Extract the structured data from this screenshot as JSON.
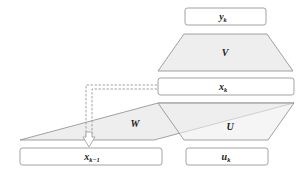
{
  "diagram": {
    "type": "recurrent-network-unrolled-step",
    "nodes": {
      "output": {
        "label": "y",
        "subscript": "k"
      },
      "hidden": {
        "label": "x",
        "subscript": "k"
      },
      "prev_hidden": {
        "label": "x",
        "subscript": "k−1"
      },
      "input": {
        "label": "u",
        "subscript": "k"
      }
    },
    "weights": {
      "V": {
        "label": "V"
      },
      "W": {
        "label": "W"
      },
      "U": {
        "label": "U"
      }
    },
    "edges": [
      {
        "from": "hidden",
        "to": "prev_hidden",
        "style": "dashed-double-arrow"
      }
    ],
    "colors": {
      "box_fill": "#ffffff",
      "shape_fill": "#eeeeee",
      "stroke": "#8a8a8a",
      "dashed": "#9a9a9a",
      "text": "#222222"
    }
  }
}
